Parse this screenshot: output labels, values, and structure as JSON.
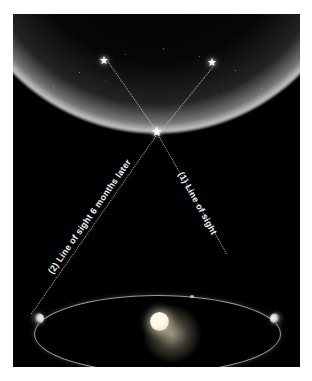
{
  "figure": {
    "background_color": "#ffffff",
    "panel_color": "#000000"
  },
  "labels": {
    "line_of_sight_1": "(1) Line of sight",
    "line_of_sight_2": "(2) Line of sight 6 months later"
  },
  "icons": {
    "star_glyph": "★",
    "nearby_star": "★",
    "background_star_left": "★",
    "background_star_right": "★"
  },
  "objects": {
    "sun_name": "Sun",
    "earth_position_1_name": "Earth",
    "earth_position_2_name": "Earth 6 months later",
    "orbit_name": "Earth's orbit",
    "celestial_dome_name": "Distant star field"
  },
  "colors": {
    "sky": "#000000",
    "star": "#ffffff",
    "sight_line": "#cdcdcd",
    "orbit": "#c8c8c8",
    "sun": "#fdf8e2",
    "label_text": "#f2f2f2"
  }
}
